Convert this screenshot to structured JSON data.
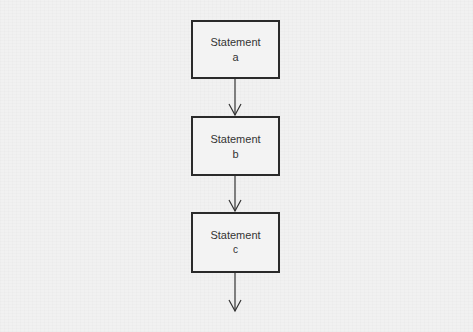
{
  "diagram": {
    "type": "flowchart",
    "direction": "top-to-bottom",
    "nodes": [
      {
        "id": "a",
        "line1": "Statement",
        "line2": "a"
      },
      {
        "id": "b",
        "line1": "Statement",
        "line2": "b"
      },
      {
        "id": "c",
        "line1": "Statement",
        "line2": "c"
      }
    ],
    "edges": [
      {
        "from": "a",
        "to": "b"
      },
      {
        "from": "b",
        "to": "c"
      },
      {
        "from": "c",
        "to": "continuation"
      }
    ]
  }
}
